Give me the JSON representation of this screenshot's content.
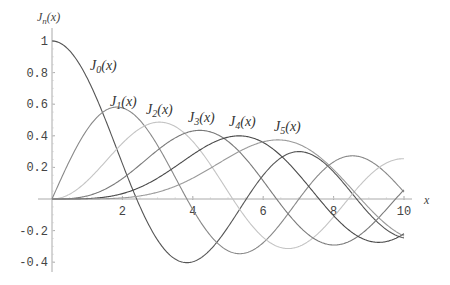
{
  "chart_data": {
    "type": "line",
    "title": "",
    "xlabel": "x",
    "ylabel": "J_n(x)",
    "xlim": [
      0,
      10
    ],
    "ylim": [
      -0.4,
      1
    ],
    "grid": false,
    "legend": "inline labels",
    "x_ticks": [
      2,
      4,
      6,
      8,
      10
    ],
    "y_ticks": [
      1,
      0.8,
      0.6,
      0.4,
      0.2,
      -0.2,
      -0.4
    ],
    "x": [
      0,
      1,
      2,
      3,
      4,
      5,
      6,
      7,
      8,
      9,
      10
    ],
    "series": [
      {
        "name": "J0(x)",
        "order": 0,
        "color": "#555555",
        "values": [
          1.0,
          0.765,
          0.224,
          -0.26,
          -0.397,
          -0.178,
          0.151,
          0.3,
          0.172,
          -0.09,
          -0.246
        ]
      },
      {
        "name": "J1(x)",
        "order": 1,
        "color": "#888888",
        "values": [
          0.0,
          0.44,
          0.577,
          0.339,
          -0.066,
          -0.328,
          -0.277,
          -0.005,
          0.235,
          0.245,
          0.043
        ]
      },
      {
        "name": "J2(x)",
        "order": 2,
        "color": "#c4c4c4",
        "values": [
          0.0,
          0.115,
          0.353,
          0.486,
          0.364,
          0.047,
          -0.243,
          -0.301,
          -0.113,
          0.145,
          0.255
        ]
      },
      {
        "name": "J3(x)",
        "order": 3,
        "color": "#7a7a7a",
        "values": [
          0.0,
          0.02,
          0.129,
          0.309,
          0.43,
          0.365,
          0.115,
          -0.168,
          -0.291,
          -0.181,
          0.058
        ]
      },
      {
        "name": "J4(x)",
        "order": 4,
        "color": "#4a4a4a",
        "values": [
          0.0,
          0.002,
          0.034,
          0.132,
          0.281,
          0.391,
          0.358,
          0.158,
          -0.105,
          -0.265,
          -0.22
        ]
      },
      {
        "name": "J5(x)",
        "order": 5,
        "color": "#9a9a9a",
        "values": [
          0.0,
          0.0,
          0.007,
          0.043,
          0.132,
          0.261,
          0.362,
          0.348,
          0.186,
          -0.055,
          -0.234
        ]
      }
    ],
    "annotations": [
      {
        "text": "J0(x)",
        "sub": "0",
        "x": 90,
        "y": 70
      },
      {
        "text": "J1(x)",
        "sub": "1",
        "x": 110,
        "y": 106
      },
      {
        "text": "J2(x)",
        "sub": "2",
        "x": 146,
        "y": 114
      },
      {
        "text": "J3(x)",
        "sub": "3",
        "x": 188,
        "y": 122
      },
      {
        "text": "J4(x)",
        "sub": "4",
        "x": 229,
        "y": 126
      },
      {
        "text": "J5(x)",
        "sub": "5",
        "x": 274,
        "y": 131
      }
    ]
  },
  "labels": {
    "y_axis": "J",
    "y_axis_sub": "n",
    "y_axis_arg": "(x)",
    "x_axis": "x",
    "ticks_x": [
      "2",
      "4",
      "6",
      "8",
      "10"
    ],
    "ticks_y": [
      "1",
      "0.8",
      "0.6",
      "0.4",
      "0.2",
      "-0.2",
      "-0.4"
    ]
  }
}
